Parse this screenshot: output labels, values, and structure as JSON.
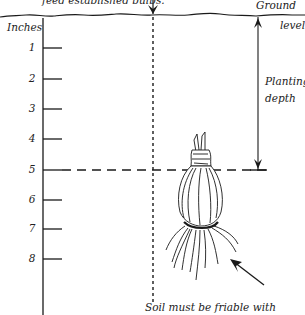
{
  "diagram": {
    "top_caption": "feed established bulbs.",
    "ground_label_line1": "Ground",
    "ground_label_line2": "level",
    "depth_label_line1": "Planting",
    "depth_label_line2": "depth",
    "ruler_unit": "Inches",
    "ruler_ticks": [
      "1",
      "2",
      "3",
      "4",
      "5",
      "6",
      "7",
      "8"
    ],
    "planting_depth_inches": 5,
    "bottom_caption": "Soil must be friable with",
    "colors": {
      "ink": "#1a1a1a",
      "background": "#ffffff"
    }
  }
}
